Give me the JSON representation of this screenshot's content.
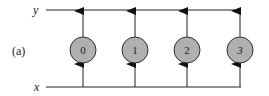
{
  "figure": {
    "panel_label": "(a)",
    "top_line_label": "y",
    "bottom_line_label": "x",
    "nodes": [
      {
        "label": "0",
        "cx": 83
      },
      {
        "label": "1",
        "cx": 135
      },
      {
        "label": "2",
        "cx": 187
      },
      {
        "label": "3",
        "cx": 240
      }
    ],
    "colors": {
      "node_fill": "#b0b0b0",
      "stroke": "#222222"
    }
  }
}
